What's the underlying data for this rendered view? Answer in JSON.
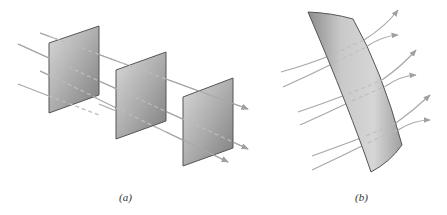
{
  "figure": {
    "panels": [
      {
        "id": "a",
        "caption": "(a)",
        "description": "Field lines passing straight through three parallel flat planar surfaces",
        "surface_count": 3,
        "field_line_count": 4
      },
      {
        "id": "b",
        "caption": "(b)",
        "description": "Curved field lines passing through a single curved surface",
        "surface_count": 1,
        "field_line_count": 6
      }
    ],
    "colors": {
      "surface_light": "#d4d4d4",
      "surface_dark": "#7a7a7a",
      "surface_edge": "#555555",
      "field_line": "#a8a8a8",
      "background": "#ffffff"
    }
  }
}
